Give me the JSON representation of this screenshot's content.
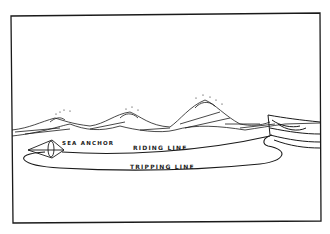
{
  "figure": {
    "labels": {
      "sea_anchor": "SEA ANCHOR",
      "riding_line": "RIDING LINE",
      "tripping_line": "TRIPPING LINE"
    },
    "colors": {
      "ink": "#1a1a1a",
      "paper": "#ffffff"
    }
  }
}
